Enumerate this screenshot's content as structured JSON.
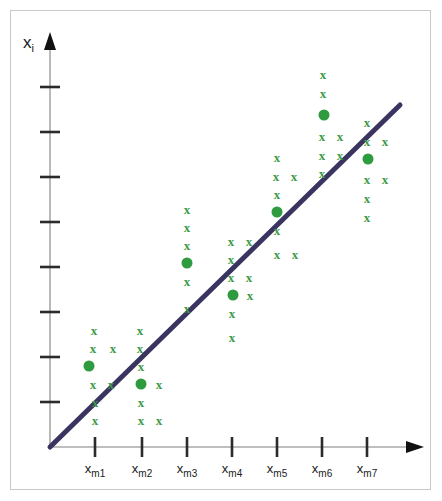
{
  "figure": {
    "axis_label_y": "x",
    "axis_label_y_sub": "i",
    "axis_color": "#9a9a9a",
    "arrow_color": "#111111",
    "frame_color": "#c9c9c9",
    "background": "#ffffff"
  },
  "colors": {
    "marker_green": "#3d9a47",
    "mean_dot_green": "#2e9b3e",
    "regression_line": "#3a3560"
  },
  "axes": {
    "y": {
      "label": "x",
      "label_sub": "i",
      "tick_count": 8,
      "tick_values": [
        1,
        2,
        3,
        4,
        5,
        6,
        7,
        8
      ],
      "tick_labels": [
        "",
        "",
        "",
        "",
        "",
        "",
        "",
        ""
      ],
      "origin_px": {
        "x": 50,
        "y": 447
      },
      "top_px": 45
    },
    "x": {
      "tick_count": 7,
      "tick_labels": [
        {
          "base": "x",
          "sub": "m1"
        },
        {
          "base": "x",
          "sub": "m2"
        },
        {
          "base": "x",
          "sub": "m3"
        },
        {
          "base": "x",
          "sub": "m4"
        },
        {
          "base": "x",
          "sub": "m5"
        },
        {
          "base": "x",
          "sub": "m6"
        },
        {
          "base": "x",
          "sub": "m7"
        }
      ],
      "right_px": 420
    }
  },
  "chart_data": {
    "type": "scatter",
    "title": "",
    "xlabel": "",
    "ylabel": "x_i",
    "grid": false,
    "legend": null,
    "xlim": [
      0,
      8
    ],
    "ylim": [
      0,
      9
    ],
    "categories": [
      "x_m1",
      "x_m2",
      "x_m3",
      "x_m4",
      "x_m5",
      "x_m6",
      "x_m7"
    ],
    "marker_symbol": "x",
    "mean_symbol": "filled-circle",
    "series": [
      {
        "name": "observations",
        "marker": "x",
        "color": "#3d9a47",
        "clusters": [
          {
            "group": "x_m1",
            "x_px": 95,
            "mean_px": {
              "x": 89,
              "y": 366
            },
            "points_px": [
              {
                "x": 94,
                "y": 330
              },
              {
                "x": 93,
                "y": 348
              },
              {
                "x": 113,
                "y": 348
              },
              {
                "x": 93,
                "y": 384
              },
              {
                "x": 111,
                "y": 384
              },
              {
                "x": 95,
                "y": 402
              },
              {
                "x": 95,
                "y": 420
              }
            ]
          },
          {
            "group": "x_m2",
            "x_px": 142,
            "mean_px": {
              "x": 141,
              "y": 384
            },
            "points_px": [
              {
                "x": 140,
                "y": 330
              },
              {
                "x": 140,
                "y": 348
              },
              {
                "x": 141,
                "y": 366
              },
              {
                "x": 159,
                "y": 384
              },
              {
                "x": 141,
                "y": 402
              },
              {
                "x": 141,
                "y": 420
              },
              {
                "x": 159,
                "y": 420
              }
            ]
          },
          {
            "group": "x_m3",
            "x_px": 187,
            "mean_px": {
              "x": 187,
              "y": 263
            },
            "points_px": [
              {
                "x": 187,
                "y": 209
              },
              {
                "x": 187,
                "y": 227
              },
              {
                "x": 187,
                "y": 245
              },
              {
                "x": 187,
                "y": 281
              },
              {
                "x": 187,
                "y": 308
              }
            ]
          },
          {
            "group": "x_m4",
            "x_px": 232,
            "mean_px": {
              "x": 233,
              "y": 295
            },
            "points_px": [
              {
                "x": 231,
                "y": 241
              },
              {
                "x": 249,
                "y": 241
              },
              {
                "x": 231,
                "y": 259
              },
              {
                "x": 231,
                "y": 277
              },
              {
                "x": 249,
                "y": 277
              },
              {
                "x": 250,
                "y": 295
              },
              {
                "x": 232,
                "y": 313
              },
              {
                "x": 232,
                "y": 337
              }
            ]
          },
          {
            "group": "x_m5",
            "x_px": 277,
            "mean_px": {
              "x": 277,
              "y": 212
            },
            "points_px": [
              {
                "x": 277,
                "y": 157
              },
              {
                "x": 276,
                "y": 176
              },
              {
                "x": 294,
                "y": 176
              },
              {
                "x": 277,
                "y": 194
              },
              {
                "x": 277,
                "y": 230
              },
              {
                "x": 277,
                "y": 254
              },
              {
                "x": 295,
                "y": 254
              }
            ]
          },
          {
            "group": "x_m6",
            "x_px": 322,
            "mean_px": {
              "x": 324,
              "y": 115
            },
            "points_px": [
              {
                "x": 323,
                "y": 74
              },
              {
                "x": 323,
                "y": 93
              },
              {
                "x": 322,
                "y": 136
              },
              {
                "x": 340,
                "y": 136
              },
              {
                "x": 322,
                "y": 155
              },
              {
                "x": 340,
                "y": 155
              },
              {
                "x": 322,
                "y": 173
              }
            ]
          },
          {
            "group": "x_m7",
            "x_px": 367,
            "mean_px": {
              "x": 368,
              "y": 159
            },
            "points_px": [
              {
                "x": 367,
                "y": 122
              },
              {
                "x": 367,
                "y": 141
              },
              {
                "x": 385,
                "y": 141
              },
              {
                "x": 367,
                "y": 179
              },
              {
                "x": 385,
                "y": 179
              },
              {
                "x": 367,
                "y": 198
              },
              {
                "x": 367,
                "y": 217
              }
            ]
          }
        ]
      }
    ],
    "regression_line": {
      "name": "fitted-line",
      "color": "#3a3560",
      "width_px": 5,
      "start_px": {
        "x": 50,
        "y": 447
      },
      "end_px": {
        "x": 400,
        "y": 105
      }
    },
    "annotations": []
  }
}
